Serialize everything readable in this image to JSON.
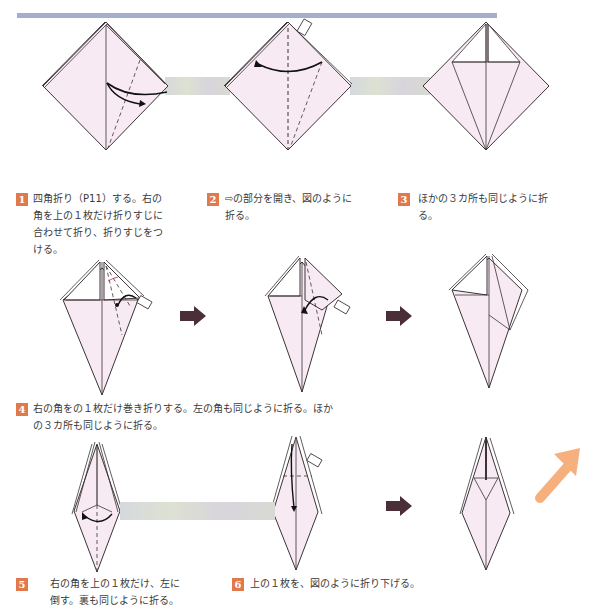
{
  "page": {
    "header_bar_color": "#a3afcc",
    "accent_color": "#e07a4c",
    "paper_color": "#f7eaf3",
    "line_color": "#3b3436",
    "next_arrow_color": "#4b2f38",
    "continue_arrow_color": "#f6b07e"
  },
  "steps": [
    {
      "number": "1",
      "text": "四角折り（P11）する。右の角を上の１枚だけ折りすじに合わせて折り、折りすじをつける。",
      "lines": [
        "四角折り（P11）する。右の",
        "角を上の１枚だけ折りすじに",
        "合わせて折り、折りすじをつ",
        "ける。"
      ]
    },
    {
      "number": "2",
      "text": "⇨の部分を開き、図のように折る。",
      "lines": [
        "⇨の部分を開き、図のように",
        "折る。"
      ]
    },
    {
      "number": "3",
      "text": "ほかの３カ所も同じように折る。",
      "lines": [
        "ほかの３カ所も同じように折",
        "る。"
      ]
    },
    {
      "number": "4",
      "text": "右の角をの１枚だけ巻き折りする。左の角も同じように折る。ほかの３カ所も同じように折る。",
      "lines": [
        "右の角をの１枚だけ巻き折りする。左の角も同じように折る。ほか",
        "の３カ所も同じように折る。"
      ]
    },
    {
      "number": "5",
      "text": "右の角を上の１枚だけ、左に倒す。裏も同じように折る。",
      "lines": [
        "右の角を上の１枚だけ、左に",
        "倒す。裏も同じように折る。"
      ]
    },
    {
      "number": "6",
      "text": "上の１枚を、図のように折り下げる。",
      "lines": [
        "上の１枚を、図のように折り下げる。"
      ]
    }
  ],
  "icons": {
    "next_arrow": "right-arrow-icon",
    "continue_arrow": "up-right-arrow-icon",
    "open_here": "open-pointer-icon"
  }
}
